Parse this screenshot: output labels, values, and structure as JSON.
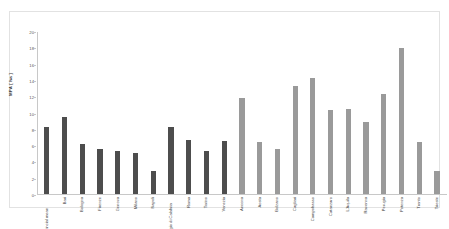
{
  "chart_data": {
    "type": "bar",
    "title": "",
    "xlabel": "",
    "ylabel": "MPA [ ha ]",
    "ylim": [
      0,
      20
    ],
    "yticks": [
      0,
      2,
      4,
      6,
      8,
      10,
      12,
      14,
      16,
      18,
      20
    ],
    "grid": false,
    "legend": "none",
    "categories": [
      "Provincial mean",
      "Bari",
      "Bologna",
      "Firenze",
      "Genova",
      "Milano",
      "Napoli",
      "Reggio di Calabria",
      "Roma",
      "Torino",
      "Venezia",
      "Ancona",
      "Aosta",
      "Bolzano",
      "Cagliari",
      "Campobasso",
      "Catanzaro",
      "L'Aquila",
      "Ravenna",
      "Perugia",
      "Potenza",
      "Trento",
      "Trieste"
    ],
    "values": [
      8.3,
      9.5,
      6.2,
      5.6,
      5.3,
      5.1,
      2.9,
      8.3,
      6.7,
      5.3,
      6.6,
      11.9,
      6.4,
      5.5,
      13.3,
      14.3,
      10.4,
      10.5,
      8.9,
      12.4,
      18.0,
      6.4,
      2.9
    ],
    "bar_colors": [
      "#4d4d4d",
      "#4d4d4d",
      "#4d4d4d",
      "#4d4d4d",
      "#4d4d4d",
      "#4d4d4d",
      "#4d4d4d",
      "#4d4d4d",
      "#4d4d4d",
      "#4d4d4d",
      "#4d4d4d",
      "#9a9a9a",
      "#9a9a9a",
      "#9a9a9a",
      "#9a9a9a",
      "#9a9a9a",
      "#9a9a9a",
      "#9a9a9a",
      "#9a9a9a",
      "#9a9a9a",
      "#9a9a9a",
      "#9a9a9a",
      "#9a9a9a"
    ],
    "colors": {
      "series_dark": "#4d4d4d",
      "series_light": "#9a9a9a",
      "axis": "#c8c8c8",
      "frame": "#e2e2e2",
      "text": "#3f3f3f",
      "background": "#ffffff"
    }
  }
}
